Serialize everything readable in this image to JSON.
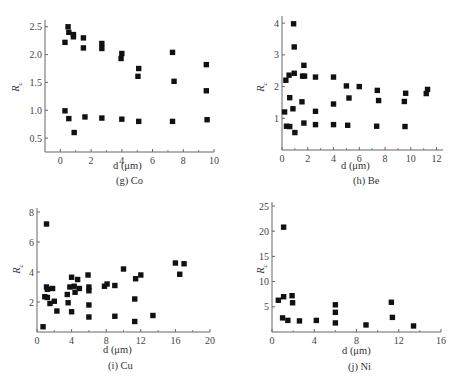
{
  "chart_data": [
    {
      "id": "g",
      "type": "scatter",
      "caption": "(g)  Co",
      "title": "",
      "xlabel": "d  (μm)",
      "ylabel": "Rc",
      "xlim": [
        -1,
        10
      ],
      "ylim": [
        0.25,
        2.55
      ],
      "xticks": [
        0,
        2,
        4,
        6,
        8,
        10
      ],
      "yticks": [
        0.5,
        1.0,
        1.5,
        2.0,
        2.5
      ],
      "ytick_labels": [
        "0.5",
        "1.0",
        "1.5",
        "2.0",
        "2.5"
      ],
      "grid": false,
      "marker": "square",
      "points": [
        [
          0.3,
          2.22
        ],
        [
          0.5,
          2.5
        ],
        [
          0.55,
          2.4
        ],
        [
          0.85,
          2.36
        ],
        [
          0.85,
          2.32
        ],
        [
          1.5,
          2.3
        ],
        [
          1.5,
          2.12
        ],
        [
          2.7,
          2.2
        ],
        [
          2.7,
          2.11
        ],
        [
          4.0,
          2.02
        ],
        [
          3.95,
          1.93
        ],
        [
          5.1,
          1.75
        ],
        [
          5.05,
          1.61
        ],
        [
          7.3,
          2.04
        ],
        [
          7.4,
          1.52
        ],
        [
          9.5,
          1.82
        ],
        [
          9.5,
          1.35
        ],
        [
          0.3,
          0.99
        ],
        [
          0.55,
          0.85
        ],
        [
          0.9,
          0.6
        ],
        [
          1.6,
          0.88
        ],
        [
          2.7,
          0.86
        ],
        [
          4.0,
          0.84
        ],
        [
          5.1,
          0.8
        ],
        [
          7.3,
          0.8
        ],
        [
          9.55,
          0.83
        ]
      ]
    },
    {
      "id": "h",
      "type": "scatter",
      "caption": "(h)  Be",
      "title": "",
      "xlabel": "d  (μm)",
      "ylabel": "Rc",
      "xlim": [
        0,
        12.5
      ],
      "ylim": [
        0,
        4.1
      ],
      "xticks": [
        0,
        2,
        4,
        6,
        8,
        10,
        12
      ],
      "yticks": [
        1,
        2,
        3,
        4
      ],
      "ytick_labels": [
        "1",
        "2",
        "3",
        "4"
      ],
      "grid": false,
      "marker": "square",
      "points": [
        [
          0.9,
          3.98
        ],
        [
          0.95,
          3.25
        ],
        [
          1.7,
          2.67
        ],
        [
          0.3,
          2.2
        ],
        [
          0.55,
          2.36
        ],
        [
          0.95,
          2.42
        ],
        [
          1.6,
          2.33
        ],
        [
          1.75,
          2.33
        ],
        [
          2.6,
          2.3
        ],
        [
          4.0,
          2.3
        ],
        [
          5.0,
          2.02
        ],
        [
          6.0,
          2.0
        ],
        [
          7.4,
          1.88
        ],
        [
          9.6,
          1.79
        ],
        [
          11.3,
          1.91
        ],
        [
          11.2,
          1.78
        ],
        [
          0.6,
          1.65
        ],
        [
          1.55,
          1.52
        ],
        [
          5.2,
          1.64
        ],
        [
          7.5,
          1.56
        ],
        [
          9.5,
          1.53
        ],
        [
          0.2,
          1.2
        ],
        [
          0.85,
          1.3
        ],
        [
          2.6,
          1.22
        ],
        [
          4.0,
          1.45
        ],
        [
          0.35,
          0.75
        ],
        [
          0.6,
          0.74
        ],
        [
          1.0,
          0.55
        ],
        [
          1.7,
          0.85
        ],
        [
          2.6,
          0.8
        ],
        [
          4.0,
          0.8
        ],
        [
          5.1,
          0.78
        ],
        [
          7.35,
          0.75
        ],
        [
          9.55,
          0.74
        ]
      ]
    },
    {
      "id": "i",
      "type": "scatter",
      "caption": "(i)  Cu",
      "title": "",
      "xlabel": "d  (μm)",
      "ylabel": "Rc",
      "xlim": [
        0,
        20
      ],
      "ylim": [
        0,
        8
      ],
      "xticks": [
        0,
        4,
        8,
        12,
        16,
        20
      ],
      "yticks": [
        2,
        4,
        6,
        8
      ],
      "ytick_labels": [
        "2",
        "4",
        "6",
        "8"
      ],
      "grid": false,
      "marker": "square",
      "points": [
        [
          1.1,
          7.2
        ],
        [
          0.7,
          0.35
        ],
        [
          0.9,
          2.35
        ],
        [
          1.2,
          2.3
        ],
        [
          1.1,
          3.0
        ],
        [
          1.2,
          2.85
        ],
        [
          1.5,
          1.9
        ],
        [
          1.8,
          2.9
        ],
        [
          2.0,
          2.05
        ],
        [
          2.3,
          1.4
        ],
        [
          3.5,
          2.5
        ],
        [
          3.6,
          1.95
        ],
        [
          3.8,
          3.0
        ],
        [
          4.0,
          3.65
        ],
        [
          4.0,
          1.35
        ],
        [
          4.3,
          3.05
        ],
        [
          4.4,
          2.65
        ],
        [
          4.7,
          3.5
        ],
        [
          4.9,
          2.9
        ],
        [
          5.9,
          3.8
        ],
        [
          6.0,
          3.0
        ],
        [
          6.0,
          2.75
        ],
        [
          6.0,
          1.8
        ],
        [
          6.0,
          1.0
        ],
        [
          7.8,
          3.05
        ],
        [
          8.1,
          3.2
        ],
        [
          9.0,
          3.1
        ],
        [
          9.0,
          1.05
        ],
        [
          10.0,
          4.2
        ],
        [
          11.3,
          2.2
        ],
        [
          11.4,
          3.55
        ],
        [
          11.3,
          0.7
        ],
        [
          12.0,
          3.8
        ],
        [
          13.4,
          1.1
        ],
        [
          16.0,
          4.6
        ],
        [
          16.5,
          3.85
        ],
        [
          17.0,
          4.55
        ]
      ]
    },
    {
      "id": "j",
      "type": "scatter",
      "caption": "(j)  Ni",
      "title": "",
      "xlabel": "d  (μm)",
      "ylabel": "Rc",
      "xlim": [
        0,
        16
      ],
      "ylim": [
        0,
        25
      ],
      "xticks": [
        0,
        4,
        8,
        12,
        16
      ],
      "yticks": [
        5,
        10,
        15,
        20,
        25
      ],
      "ytick_labels": [
        "5",
        "10",
        "15",
        "20",
        "25"
      ],
      "grid": false,
      "marker": "square",
      "points": [
        [
          1.1,
          20.8
        ],
        [
          0.6,
          6.3
        ],
        [
          1.1,
          7.0
        ],
        [
          1.9,
          7.2
        ],
        [
          1.95,
          5.8
        ],
        [
          1.0,
          2.8
        ],
        [
          1.5,
          2.3
        ],
        [
          2.6,
          2.2
        ],
        [
          4.2,
          2.3
        ],
        [
          6.0,
          5.4
        ],
        [
          6.0,
          3.9
        ],
        [
          6.0,
          1.8
        ],
        [
          8.9,
          1.4
        ],
        [
          11.3,
          5.9
        ],
        [
          11.4,
          2.9
        ],
        [
          13.4,
          1.2
        ]
      ]
    }
  ]
}
